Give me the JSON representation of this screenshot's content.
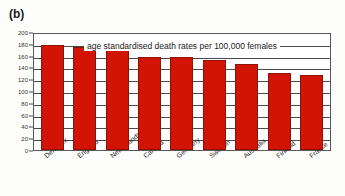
{
  "panel": {
    "label": "(b)"
  },
  "chart_data": {
    "type": "bar",
    "title": "age standardised death rates per 100,000 females",
    "xlabel": "",
    "ylabel": "",
    "ylim": [
      0,
      200
    ],
    "ytick_step": 20,
    "grid": true,
    "legend": "none",
    "bar_color": "#d21404",
    "bar_border_color": "#8a1208",
    "categories": [
      "Denmark",
      "England",
      "Netherlands",
      "Canada",
      "Germany",
      "Sweden",
      "Australia",
      "Finland",
      "France"
    ],
    "values": [
      178,
      175,
      170,
      157,
      157,
      153,
      145,
      131,
      127
    ],
    "yticks": [
      0,
      20,
      40,
      60,
      80,
      100,
      120,
      140,
      160,
      180,
      200
    ],
    "ytick_labels": [
      "0",
      "20",
      "40",
      "60",
      "80",
      "100",
      "120",
      "140",
      "160",
      "180",
      "200"
    ]
  }
}
